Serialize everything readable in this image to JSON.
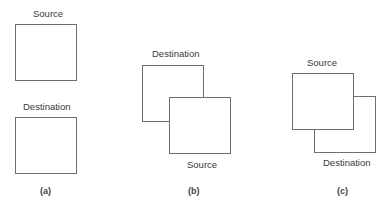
{
  "panels": [
    {
      "id": "a",
      "caption": "(a)",
      "description": "Source and destination regions separate (no overlap)",
      "boxes": [
        {
          "label": "Source",
          "x": 15,
          "y": 24,
          "w": 62,
          "h": 57
        },
        {
          "label": "Destination",
          "x": 15,
          "y": 117,
          "w": 62,
          "h": 57
        }
      ]
    },
    {
      "id": "b",
      "caption": "(b)",
      "description": "Source overlaps destination; source below-right",
      "boxes": [
        {
          "label": "Destination",
          "x": 142,
          "y": 65,
          "w": 62,
          "h": 57
        },
        {
          "label": "Source",
          "x": 169,
          "y": 97,
          "w": 62,
          "h": 57
        }
      ]
    },
    {
      "id": "c",
      "caption": "(c)",
      "description": "Source overlaps destination; destination below-right",
      "boxes": [
        {
          "label": "Source",
          "x": 292,
          "y": 73,
          "w": 62,
          "h": 57
        },
        {
          "label": "Destination",
          "x": 314,
          "y": 96,
          "w": 62,
          "h": 57
        }
      ]
    }
  ],
  "colors": {
    "line": "#6f6f6f",
    "text": "#3a3a3a",
    "background": "#ffffff"
  }
}
